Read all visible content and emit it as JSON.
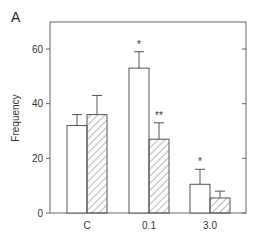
{
  "panel_label": "A",
  "chart_data": {
    "type": "bar",
    "title": "",
    "xlabel": "",
    "ylabel": "Frequency",
    "ylim": [
      0,
      70
    ],
    "yticks": [
      0,
      20,
      40,
      60
    ],
    "ytick_labels": [
      "0",
      "20",
      "40",
      "60"
    ],
    "categories": [
      "C",
      "0.1",
      "3.0"
    ],
    "grid": false,
    "legend": null,
    "series": [
      {
        "name": "open (white) bars",
        "style": "white",
        "values": [
          32,
          53,
          10.5
        ],
        "errors": [
          4,
          6,
          5.5
        ],
        "significance": [
          "",
          "*",
          "*"
        ]
      },
      {
        "name": "hatched bars",
        "style": "hatched",
        "values": [
          36,
          27,
          5.5
        ],
        "errors": [
          7,
          6,
          2.5
        ],
        "significance": [
          "",
          "**",
          ""
        ]
      }
    ]
  }
}
